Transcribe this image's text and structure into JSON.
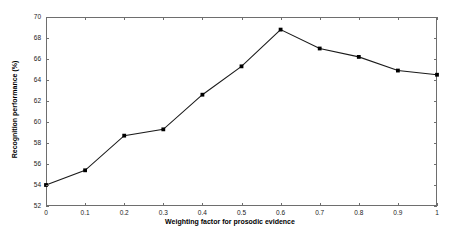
{
  "chart_data": {
    "type": "line",
    "title": "",
    "xlabel": "Weighting factor for prosodic evidence",
    "ylabel": "Recognition performance (%)",
    "x": [
      0,
      0.1,
      0.2,
      0.3,
      0.4,
      0.5,
      0.6,
      0.7,
      0.8,
      0.9,
      1
    ],
    "values": [
      54.0,
      55.4,
      58.7,
      59.3,
      62.6,
      65.3,
      68.8,
      67.0,
      66.2,
      64.9,
      64.5
    ],
    "xticklabels": [
      "0",
      "0.1",
      "0.2",
      "0.3",
      "0.4",
      "0.5",
      "0.6",
      "0.7",
      "0.8",
      "0.9",
      "1"
    ],
    "yticklabels": [
      "52",
      "54",
      "56",
      "58",
      "60",
      "62",
      "64",
      "66",
      "68",
      "70"
    ],
    "yticks": [
      52,
      54,
      56,
      58,
      60,
      62,
      64,
      66,
      68,
      70
    ],
    "xlim": [
      0,
      1
    ],
    "ylim": [
      52,
      70
    ],
    "grid": false,
    "legend": null,
    "marker": "square",
    "line_color": "#1a1a1a",
    "marker_color": "#000000",
    "axis_color": "#6e6e6e",
    "background": "#ffffff"
  }
}
